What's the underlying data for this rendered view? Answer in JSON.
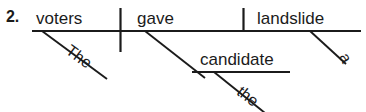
{
  "exercise": {
    "number_label": "2."
  },
  "diagram": {
    "type": "reed-kellogg-sentence-diagram",
    "sentence": "The voters gave the candidate a landslide",
    "ink_color": "#1b1b1b",
    "background_color": "#ffffff",
    "baseline": {
      "label": "main-baseline",
      "x1": 32,
      "y1": 31,
      "x2": 361,
      "y2": 31
    },
    "subject_verb_divider": {
      "label": "subject-verb-divider",
      "x1": 120,
      "y1": 8,
      "x2": 120,
      "y2": 52
    },
    "verb_object_divider": {
      "label": "verb-object-divider",
      "x1": 243,
      "y1": 8,
      "x2": 243,
      "y2": 31
    },
    "indirect_object_branch": {
      "label": "indirect-object-slant",
      "x1": 145,
      "y1": 31,
      "x2": 205,
      "y2": 78
    },
    "indirect_object_baseline": {
      "label": "indirect-object-baseline",
      "x1": 192,
      "y1": 72,
      "x2": 290,
      "y2": 72
    },
    "modifier_slashes": [
      {
        "label": "the-subject-slash",
        "x1": 42,
        "y1": 31,
        "x2": 107,
        "y2": 79
      },
      {
        "label": "the-iobj-slash",
        "x1": 214,
        "y1": 72,
        "x2": 264,
        "y2": 112
      },
      {
        "label": "a-dobj-slash",
        "x1": 310,
        "y1": 31,
        "x2": 346,
        "y2": 64
      }
    ],
    "words": {
      "subject": "voters",
      "verb": "gave",
      "direct_object": "landslide",
      "indirect_object": "candidate"
    },
    "modifiers": {
      "subject_article": "The",
      "indirect_object_article": "the",
      "direct_object_article": "a"
    }
  }
}
